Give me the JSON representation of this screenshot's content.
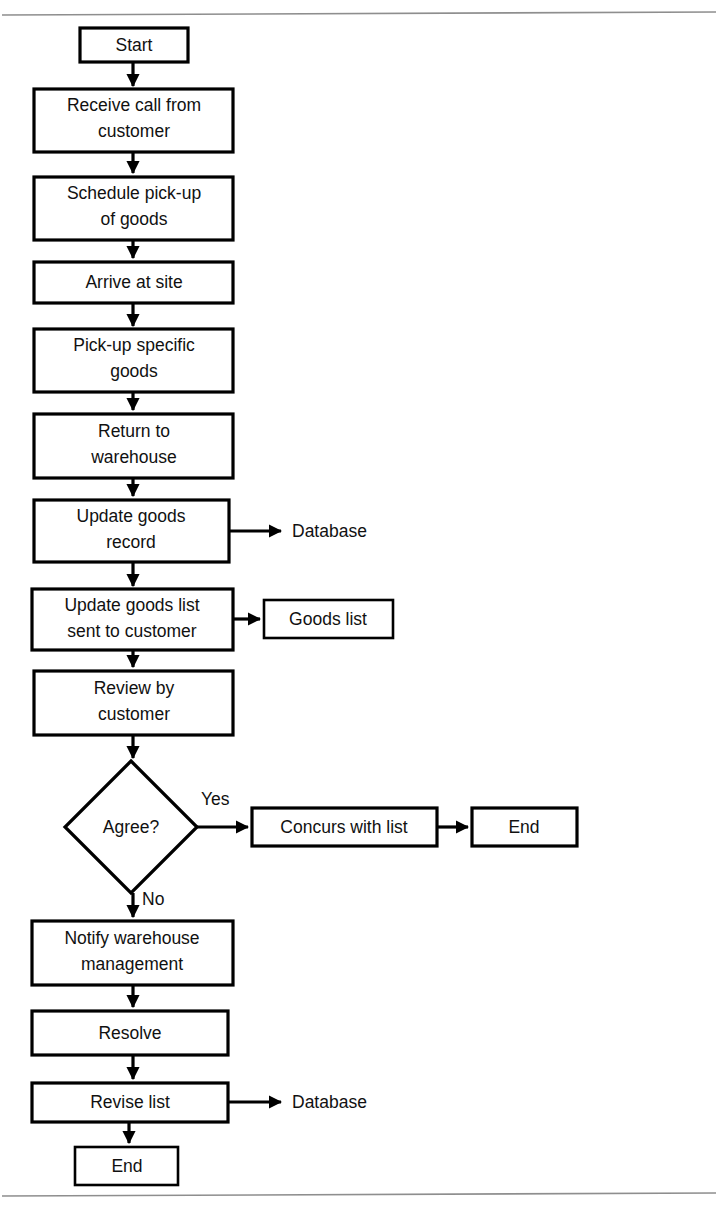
{
  "document": {
    "type": "flowchart",
    "title": "Goods pick-up and list revision process flowchart",
    "orientation": "top-to-bottom",
    "background_color": "#ffffff",
    "line_color": "#000000",
    "text_color": "#111111",
    "rule_color": "#8e8e8e"
  },
  "rules": {
    "top_rule_label": "",
    "bottom_rule_label": ""
  },
  "nodes": {
    "start": {
      "label": "Start",
      "shape": "rectangle"
    },
    "receive_call": {
      "label_line1": "Receive call from",
      "label_line2": "customer",
      "shape": "rectangle"
    },
    "schedule_pickup": {
      "label_line1": "Schedule pick-up",
      "label_line2": "of goods",
      "shape": "rectangle"
    },
    "arrive_site": {
      "label": "Arrive at site",
      "shape": "rectangle"
    },
    "pickup_goods": {
      "label_line1": "Pick-up specific",
      "label_line2": "goods",
      "shape": "rectangle"
    },
    "return_warehouse": {
      "label_line1": "Return to",
      "label_line2": "warehouse",
      "shape": "rectangle"
    },
    "update_record": {
      "label_line1": "Update goods",
      "label_line2": "record",
      "shape": "rectangle"
    },
    "update_list": {
      "label_line1": "Update goods list",
      "label_line2": "sent to customer",
      "shape": "rectangle"
    },
    "review_customer": {
      "label_line1": "Review by",
      "label_line2": "customer",
      "shape": "rectangle"
    },
    "agree_decision": {
      "label": "Agree?",
      "shape": "diamond"
    },
    "concurs_list": {
      "label": "Concurs with list",
      "shape": "rectangle"
    },
    "end_top": {
      "label": "End",
      "shape": "rectangle"
    },
    "notify_warehouse": {
      "label_line1": "Notify warehouse",
      "label_line2": "management",
      "shape": "rectangle"
    },
    "resolve": {
      "label": "Resolve",
      "shape": "rectangle"
    },
    "revise_list": {
      "label": "Revise list",
      "shape": "rectangle"
    },
    "end_bottom": {
      "label": "End",
      "shape": "rectangle"
    },
    "goods_list_store": {
      "label": "Goods list",
      "shape": "rectangle"
    }
  },
  "side_labels": {
    "database_upper": "Database",
    "database_lower": "Database"
  },
  "edge_labels": {
    "yes": "Yes",
    "no": "No"
  },
  "flow_sequence": [
    "Start",
    "Receive call from customer",
    "Schedule pick-up of goods",
    "Arrive at site",
    "Pick-up specific goods",
    "Return to warehouse",
    "Update goods record",
    "Update goods list sent to customer",
    "Review by customer",
    "Agree?",
    "Yes -> Concurs with list -> End",
    "No -> Notify warehouse management",
    "Resolve",
    "Revise list",
    "End"
  ],
  "branches": [
    {
      "from": "Update goods record",
      "to": "Database",
      "label": ""
    },
    {
      "from": "Update goods list sent to customer",
      "to": "Goods list",
      "label": ""
    },
    {
      "from": "Agree?",
      "to": "Concurs with list",
      "label": "Yes"
    },
    {
      "from": "Agree?",
      "to": "Notify warehouse management",
      "label": "No"
    },
    {
      "from": "Revise list",
      "to": "Database",
      "label": ""
    }
  ]
}
